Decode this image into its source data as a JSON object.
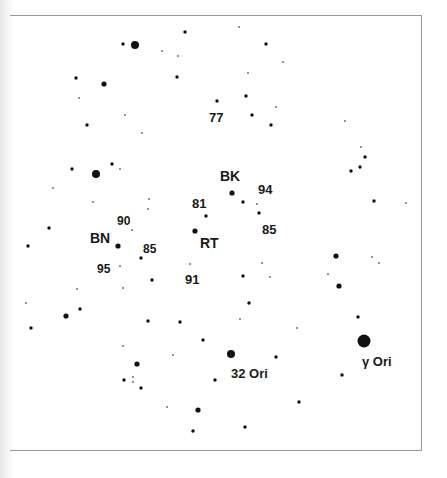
{
  "chart": {
    "frame": {
      "left": 10,
      "top": 15,
      "right": 422,
      "bottom": 451,
      "color": "#9a9a9a"
    },
    "star_color": "#111111",
    "size_classes": {
      "tiny": 1.0,
      "small": 1.7,
      "medium": 2.6,
      "large": 4.0,
      "xlarge": 6.5
    },
    "stars": [
      {
        "x": 123,
        "y": 44,
        "s": "small"
      },
      {
        "x": 135,
        "y": 45,
        "s": "large"
      },
      {
        "x": 162,
        "y": 51,
        "s": "tiny"
      },
      {
        "x": 185,
        "y": 32,
        "s": "small"
      },
      {
        "x": 177,
        "y": 77,
        "s": "small"
      },
      {
        "x": 178,
        "y": 56,
        "s": "tiny"
      },
      {
        "x": 76,
        "y": 78,
        "s": "small"
      },
      {
        "x": 104,
        "y": 84,
        "s": "medium"
      },
      {
        "x": 79,
        "y": 98,
        "s": "tiny"
      },
      {
        "x": 125,
        "y": 115,
        "s": "tiny"
      },
      {
        "x": 87,
        "y": 125,
        "s": "small"
      },
      {
        "x": 239,
        "y": 27,
        "s": "tiny"
      },
      {
        "x": 266,
        "y": 44,
        "s": "small"
      },
      {
        "x": 283,
        "y": 62,
        "s": "tiny"
      },
      {
        "x": 248,
        "y": 73,
        "s": "tiny"
      },
      {
        "x": 217,
        "y": 101,
        "s": "small"
      },
      {
        "x": 246,
        "y": 96,
        "s": "small"
      },
      {
        "x": 276,
        "y": 107,
        "s": "tiny"
      },
      {
        "x": 252,
        "y": 115,
        "s": "small"
      },
      {
        "x": 271,
        "y": 125,
        "s": "small"
      },
      {
        "x": 345,
        "y": 121,
        "s": "tiny"
      },
      {
        "x": 142,
        "y": 133,
        "s": "tiny"
      },
      {
        "x": 361,
        "y": 147,
        "s": "tiny"
      },
      {
        "x": 365,
        "y": 157,
        "s": "small"
      },
      {
        "x": 360,
        "y": 167,
        "s": "small"
      },
      {
        "x": 351,
        "y": 171,
        "s": "small"
      },
      {
        "x": 374,
        "y": 201,
        "s": "small"
      },
      {
        "x": 406,
        "y": 203,
        "s": "tiny"
      },
      {
        "x": 112,
        "y": 164,
        "s": "small"
      },
      {
        "x": 120,
        "y": 169,
        "s": "tiny"
      },
      {
        "x": 72,
        "y": 169,
        "s": "small"
      },
      {
        "x": 96,
        "y": 174,
        "s": "large"
      },
      {
        "x": 53,
        "y": 188,
        "s": "tiny"
      },
      {
        "x": 93,
        "y": 202,
        "s": "tiny"
      },
      {
        "x": 149,
        "y": 199,
        "s": "tiny"
      },
      {
        "x": 148,
        "y": 209,
        "s": "tiny"
      },
      {
        "x": 49,
        "y": 228,
        "s": "small"
      },
      {
        "x": 28,
        "y": 246,
        "s": "small"
      },
      {
        "x": 132,
        "y": 230,
        "s": "tiny"
      },
      {
        "x": 118,
        "y": 246,
        "s": "medium"
      },
      {
        "x": 141,
        "y": 258,
        "s": "small"
      },
      {
        "x": 120,
        "y": 266,
        "s": "tiny"
      },
      {
        "x": 152,
        "y": 280,
        "s": "small"
      },
      {
        "x": 123,
        "y": 288,
        "s": "tiny"
      },
      {
        "x": 232,
        "y": 193,
        "s": "medium"
      },
      {
        "x": 243,
        "y": 202,
        "s": "small"
      },
      {
        "x": 257,
        "y": 204,
        "s": "tiny"
      },
      {
        "x": 259,
        "y": 213,
        "s": "small"
      },
      {
        "x": 206,
        "y": 216,
        "s": "small"
      },
      {
        "x": 195,
        "y": 231,
        "s": "medium"
      },
      {
        "x": 190,
        "y": 264,
        "s": "tiny"
      },
      {
        "x": 262,
        "y": 263,
        "s": "tiny"
      },
      {
        "x": 243,
        "y": 276,
        "s": "small"
      },
      {
        "x": 270,
        "y": 277,
        "s": "tiny"
      },
      {
        "x": 336,
        "y": 256,
        "s": "medium"
      },
      {
        "x": 372,
        "y": 257,
        "s": "tiny"
      },
      {
        "x": 379,
        "y": 263,
        "s": "tiny"
      },
      {
        "x": 328,
        "y": 274,
        "s": "tiny"
      },
      {
        "x": 339,
        "y": 286,
        "s": "medium"
      },
      {
        "x": 77,
        "y": 289,
        "s": "tiny"
      },
      {
        "x": 26,
        "y": 303,
        "s": "tiny"
      },
      {
        "x": 80,
        "y": 309,
        "s": "small"
      },
      {
        "x": 66,
        "y": 316,
        "s": "medium"
      },
      {
        "x": 31,
        "y": 328,
        "s": "small"
      },
      {
        "x": 249,
        "y": 303,
        "s": "small"
      },
      {
        "x": 240,
        "y": 319,
        "s": "tiny"
      },
      {
        "x": 148,
        "y": 321,
        "s": "small"
      },
      {
        "x": 180,
        "y": 322,
        "s": "small"
      },
      {
        "x": 297,
        "y": 328,
        "s": "tiny"
      },
      {
        "x": 358,
        "y": 317,
        "s": "small"
      },
      {
        "x": 203,
        "y": 340,
        "s": "small"
      },
      {
        "x": 123,
        "y": 346,
        "s": "tiny"
      },
      {
        "x": 173,
        "y": 355,
        "s": "tiny"
      },
      {
        "x": 231,
        "y": 354,
        "s": "large"
      },
      {
        "x": 276,
        "y": 357,
        "s": "small"
      },
      {
        "x": 364,
        "y": 341,
        "s": "xlarge"
      },
      {
        "x": 137,
        "y": 364,
        "s": "medium"
      },
      {
        "x": 342,
        "y": 375,
        "s": "small"
      },
      {
        "x": 124,
        "y": 380,
        "s": "small"
      },
      {
        "x": 133,
        "y": 377,
        "s": "tiny"
      },
      {
        "x": 133,
        "y": 382,
        "s": "tiny"
      },
      {
        "x": 141,
        "y": 388,
        "s": "small"
      },
      {
        "x": 215,
        "y": 380,
        "s": "small"
      },
      {
        "x": 299,
        "y": 402,
        "s": "small"
      },
      {
        "x": 167,
        "y": 407,
        "s": "tiny"
      },
      {
        "x": 198,
        "y": 410,
        "s": "medium"
      },
      {
        "x": 245,
        "y": 427,
        "s": "small"
      },
      {
        "x": 193,
        "y": 431,
        "s": "small"
      }
    ],
    "labels": [
      {
        "text": "77",
        "x": 209,
        "y": 122,
        "size": 13
      },
      {
        "text": "BK",
        "x": 220,
        "y": 181,
        "size": 14
      },
      {
        "text": "94",
        "x": 258,
        "y": 194,
        "size": 13
      },
      {
        "text": "81",
        "x": 192,
        "y": 208,
        "size": 13
      },
      {
        "text": "85",
        "x": 262,
        "y": 234,
        "size": 13
      },
      {
        "text": "RT",
        "x": 200,
        "y": 248,
        "size": 14
      },
      {
        "text": "91",
        "x": 185,
        "y": 284,
        "size": 13
      },
      {
        "text": "90",
        "x": 117,
        "y": 225,
        "size": 12
      },
      {
        "text": "BN",
        "x": 90,
        "y": 243,
        "size": 14
      },
      {
        "text": "85",
        "x": 143,
        "y": 253,
        "size": 12
      },
      {
        "text": "95",
        "x": 97,
        "y": 273,
        "size": 12
      },
      {
        "text": "32 Ori",
        "x": 231,
        "y": 378,
        "size": 13
      },
      {
        "text": "γ Ori",
        "x": 362,
        "y": 366,
        "size": 13
      }
    ]
  }
}
